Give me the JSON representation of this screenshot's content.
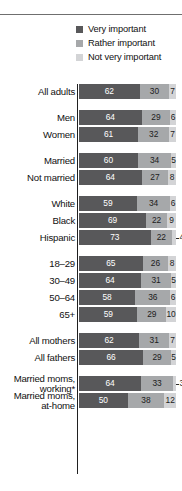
{
  "legend": {
    "items": [
      {
        "label": "Very important",
        "color": "#58585a",
        "key": "very"
      },
      {
        "label": "Rather important",
        "color": "#a6a8aa",
        "key": "rather"
      },
      {
        "label": "Not very important",
        "color": "#d3d4d6",
        "key": "not_very"
      }
    ]
  },
  "chart_data": {
    "type": "bar",
    "subtype": "stacked-horizontal-100",
    "title": "",
    "xlabel": "",
    "ylabel": "",
    "xlim": [
      0,
      100
    ],
    "grid": false,
    "legend_position": "top-right",
    "series": [
      {
        "name": "Very important",
        "color": "#58585a"
      },
      {
        "name": "Rather important",
        "color": "#a6a8aa"
      },
      {
        "name": "Not very important",
        "color": "#d3d4d6"
      }
    ],
    "groups": [
      {
        "name": "total",
        "rows": [
          {
            "label": "All adults",
            "values": [
              62,
              30,
              7
            ],
            "outside": [
              false,
              false,
              false
            ]
          }
        ]
      },
      {
        "name": "gender",
        "rows": [
          {
            "label": "Men",
            "values": [
              64,
              29,
              6
            ],
            "outside": [
              false,
              false,
              false
            ]
          },
          {
            "label": "Women",
            "values": [
              61,
              32,
              7
            ],
            "outside": [
              false,
              false,
              false
            ]
          }
        ]
      },
      {
        "name": "marital-status",
        "rows": [
          {
            "label": "Married",
            "values": [
              60,
              34,
              5
            ],
            "outside": [
              false,
              false,
              false
            ]
          },
          {
            "label": "Not married",
            "values": [
              64,
              27,
              8
            ],
            "outside": [
              false,
              false,
              false
            ]
          }
        ]
      },
      {
        "name": "race-ethnicity",
        "rows": [
          {
            "label": "White",
            "values": [
              59,
              34,
              6
            ],
            "outside": [
              false,
              false,
              false
            ]
          },
          {
            "label": "Black",
            "values": [
              69,
              22,
              9
            ],
            "outside": [
              false,
              false,
              false
            ]
          },
          {
            "label": "Hispanic",
            "values": [
              73,
              22,
              4
            ],
            "outside": [
              false,
              false,
              true
            ]
          }
        ]
      },
      {
        "name": "age",
        "rows": [
          {
            "label": "18–29",
            "values": [
              65,
              26,
              8
            ],
            "outside": [
              false,
              false,
              false
            ]
          },
          {
            "label": "30–49",
            "values": [
              64,
              31,
              5
            ],
            "outside": [
              false,
              false,
              false
            ]
          },
          {
            "label": "50–64",
            "values": [
              58,
              36,
              6
            ],
            "outside": [
              false,
              false,
              false
            ]
          },
          {
            "label": "65+",
            "values": [
              59,
              29,
              10
            ],
            "outside": [
              false,
              false,
              false
            ]
          }
        ]
      },
      {
        "name": "parents",
        "rows": [
          {
            "label": "All mothers",
            "values": [
              62,
              31,
              7
            ],
            "outside": [
              false,
              false,
              false
            ]
          },
          {
            "label": "All fathers",
            "values": [
              66,
              29,
              5
            ],
            "outside": [
              false,
              false,
              false
            ]
          }
        ]
      },
      {
        "name": "married-moms",
        "rows": [
          {
            "label": "Married moms,\nworking*",
            "values": [
              64,
              33,
              3
            ],
            "outside": [
              false,
              false,
              true
            ]
          },
          {
            "label": "Married moms,\nat-home",
            "values": [
              50,
              38,
              12
            ],
            "outside": [
              false,
              false,
              false
            ]
          }
        ]
      }
    ]
  }
}
